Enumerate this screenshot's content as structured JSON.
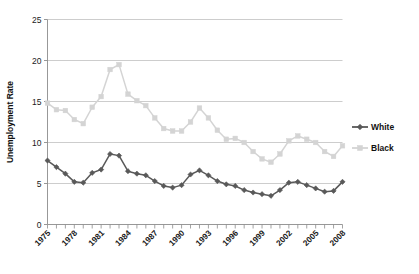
{
  "chart_data": {
    "type": "line",
    "title": "",
    "xlabel": "",
    "ylabel": "Unemployment Rate",
    "xlim": [
      1975,
      2008
    ],
    "ylim": [
      0,
      25
    ],
    "yticks": [
      0,
      5,
      10,
      15,
      20,
      25
    ],
    "xticks": [
      1975,
      1978,
      1981,
      1984,
      1987,
      1990,
      1993,
      1996,
      1999,
      2002,
      2005,
      2008
    ],
    "grid": "horizontal",
    "legend_position": "right",
    "x": [
      1975,
      1976,
      1977,
      1978,
      1979,
      1980,
      1981,
      1982,
      1983,
      1984,
      1985,
      1986,
      1987,
      1988,
      1989,
      1990,
      1991,
      1992,
      1993,
      1994,
      1995,
      1996,
      1997,
      1998,
      1999,
      2000,
      2001,
      2002,
      2003,
      2004,
      2005,
      2006,
      2007,
      2008
    ],
    "series": [
      {
        "name": "White",
        "color": "#595959",
        "marker": "diamond",
        "values": [
          7.8,
          7.0,
          6.2,
          5.2,
          5.1,
          6.3,
          6.7,
          8.6,
          8.4,
          6.5,
          6.2,
          6.0,
          5.3,
          4.7,
          4.5,
          4.8,
          6.1,
          6.6,
          6.0,
          5.3,
          4.9,
          4.7,
          4.2,
          3.9,
          3.7,
          3.5,
          4.2,
          5.1,
          5.2,
          4.8,
          4.4,
          4.0,
          4.1,
          5.2
        ]
      },
      {
        "name": "Black",
        "color": "#d4d4d4",
        "marker": "square",
        "values": [
          14.8,
          14.0,
          13.9,
          12.8,
          12.3,
          14.3,
          15.6,
          18.9,
          19.5,
          15.9,
          15.1,
          14.5,
          13.0,
          11.7,
          11.4,
          11.4,
          12.5,
          14.2,
          13.0,
          11.5,
          10.4,
          10.5,
          10.0,
          8.9,
          8.0,
          7.6,
          8.6,
          10.2,
          10.8,
          10.4,
          10.0,
          8.9,
          8.3,
          9.6
        ]
      }
    ],
    "legend": [
      {
        "label": "White",
        "color": "#595959",
        "marker": "diamond"
      },
      {
        "label": "Black",
        "color": "#d4d4d4",
        "marker": "square"
      }
    ]
  }
}
